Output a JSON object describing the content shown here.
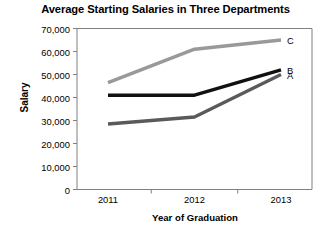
{
  "chart_data": {
    "type": "line",
    "title": "Average Starting Salaries in Three Departments",
    "xlabel": "Year of Graduation",
    "ylabel": "Salary",
    "categories": [
      "2011",
      "2012",
      "2013"
    ],
    "x": [
      2011,
      2012,
      2013
    ],
    "series": [
      {
        "name": "C",
        "label": "C",
        "color": "#999999",
        "values": [
          46500,
          61000,
          65000
        ]
      },
      {
        "name": "B",
        "label": "B",
        "color": "#111111",
        "values": [
          41000,
          41000,
          52000
        ]
      },
      {
        "name": "A",
        "label": "A",
        "color": "#5a5a5a",
        "values": [
          28500,
          31500,
          50000
        ]
      }
    ],
    "ylim": [
      0,
      70000
    ],
    "ytick_values": [
      0,
      10000,
      20000,
      30000,
      40000,
      50000,
      60000,
      70000
    ],
    "ytick_labels": [
      "0",
      "10,000",
      "20,000",
      "30,000",
      "40,000",
      "50,000",
      "60,000",
      "70,000"
    ],
    "xtick_labels": [
      "2011",
      "2012",
      "2013"
    ],
    "grid": false,
    "legend_position": "inline-right-of-line-end",
    "frame": true,
    "background_color": "#ffffff",
    "axis_color": "#808080"
  }
}
